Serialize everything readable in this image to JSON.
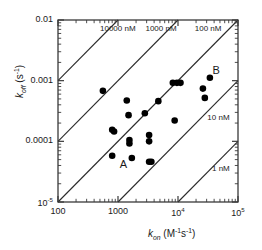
{
  "chart_data": {
    "type": "scatter",
    "title": "",
    "xlabel": "k_on (M^-1 s^-1)",
    "ylabel": "k_off (s^-1)",
    "xscale": "log",
    "yscale": "log",
    "xlim": [
      100,
      100000
    ],
    "ylim": [
      1e-05,
      0.01
    ],
    "grid": false,
    "legend": null,
    "xticks": [
      100,
      1000,
      10000,
      100000
    ],
    "xtick_labels": [
      "100",
      "1000",
      "10⁴",
      "10⁵"
    ],
    "yticks": [
      1e-05,
      0.0001,
      0.001,
      0.01
    ],
    "ytick_labels": [
      "10⁻⁵",
      "0.0001",
      "0.001",
      "0.01"
    ],
    "marker": "filled-circle",
    "marker_color": "#000000",
    "points": [
      {
        "kon": 560,
        "koff": 0.00068
      },
      {
        "kon": 800,
        "koff": 0.000155
      },
      {
        "kon": 860,
        "koff": 0.000145
      },
      {
        "kon": 800,
        "koff": 5.8e-05
      },
      {
        "kon": 1400,
        "koff": 0.00047
      },
      {
        "kon": 1500,
        "koff": 0.00027
      },
      {
        "kon": 1550,
        "koff": 0.000105
      },
      {
        "kon": 1550,
        "koff": 9.2e-05
      },
      {
        "kon": 1700,
        "koff": 5.3e-05,
        "label": "A"
      },
      {
        "kon": 2800,
        "koff": 0.00029
      },
      {
        "kon": 3300,
        "koff": 0.000127
      },
      {
        "kon": 3300,
        "koff": 0.0001
      },
      {
        "kon": 3300,
        "koff": 4.6e-05
      },
      {
        "kon": 3600,
        "koff": 4.6e-05
      },
      {
        "kon": 4700,
        "koff": 0.00046
      },
      {
        "kon": 8200,
        "koff": 0.00092
      },
      {
        "kon": 8800,
        "koff": 0.00022
      },
      {
        "kon": 9600,
        "koff": 0.00092
      },
      {
        "kon": 11000,
        "koff": 0.00092
      },
      {
        "kon": 26000,
        "koff": 0.00074
      },
      {
        "kon": 28000,
        "koff": 0.00052
      },
      {
        "kon": 34000,
        "koff": 0.00112,
        "label": "B"
      }
    ],
    "iso_lines": [
      {
        "kd_nM": 10000,
        "label": "10000 nM",
        "label_x": 1000,
        "label_y": 0.0072
      },
      {
        "kd_nM": 1000,
        "label": "1000 nM",
        "label_x": 5200,
        "label_y": 0.0072
      },
      {
        "kd_nM": 100,
        "label": "100 nM",
        "label_x": 32000,
        "label_y": 0.0072
      },
      {
        "kd_nM": 10,
        "label": "10 nM",
        "label_x": 47000,
        "label_y": 0.000245
      },
      {
        "kd_nM": 1,
        "label": "1 nM",
        "label_x": 52000,
        "label_y": 3.45e-05
      }
    ],
    "point_labels": [
      {
        "text": "A",
        "kon": 1250,
        "koff": 4.05e-05
      },
      {
        "text": "B",
        "kon": 44000,
        "koff": 0.00145
      }
    ],
    "axis_title_x": {
      "symbol": "k",
      "sub": "on",
      "unit": "(M⁻¹s⁻¹)"
    },
    "axis_title_y": {
      "symbol": "k",
      "sub": "off",
      "unit": "(s⁻¹)"
    },
    "colors": {
      "axis": "#3a3a3a",
      "marker": "#000000",
      "iso_line": "#2b2b2b",
      "text": "#1a1a1a",
      "background": "#ffffff"
    }
  }
}
